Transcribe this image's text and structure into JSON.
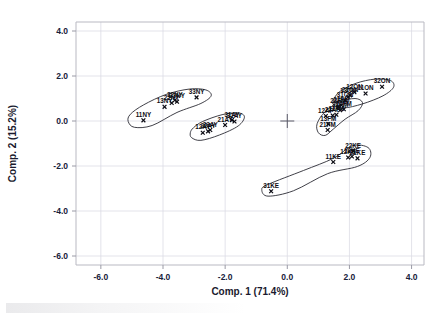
{
  "chart_data": {
    "type": "scatter",
    "title": "",
    "xlabel": "Comp. 1 (71.4%)",
    "ylabel": "Comp. 2 (15.2%)",
    "xlim": [
      -6.8,
      4.4
    ],
    "ylim": [
      -6.4,
      4.4
    ],
    "xticks": [
      "-6.0",
      "-4.0",
      "-2.0",
      "0.0",
      "2.0",
      "4.0"
    ],
    "xtick_values": [
      -6.0,
      -4.0,
      -2.0,
      0.0,
      2.0,
      4.0
    ],
    "yticks": [
      "4.0",
      "2.0",
      "0.0",
      "-2.0",
      "-4.0",
      "-6.0"
    ],
    "ytick_values": [
      4.0,
      2.0,
      0.0,
      -2.0,
      -4.0,
      -6.0
    ],
    "grid": true,
    "legend": "none",
    "marker": "x",
    "origin_cross": true,
    "groups": [
      {
        "name": "NY",
        "points": [
          {
            "label": "11NY",
            "x": -4.63,
            "y": 0.03
          },
          {
            "label": "13NY",
            "x": -3.95,
            "y": 0.63
          },
          {
            "label": "32NY",
            "x": -3.62,
            "y": 0.92
          },
          {
            "label": "22NY",
            "x": -3.72,
            "y": 0.8
          },
          {
            "label": "23NY",
            "x": -3.55,
            "y": 0.86
          },
          {
            "label": "33NY",
            "x": -2.92,
            "y": 1.05
          }
        ],
        "hull": [
          [
            -5.05,
            0.3
          ],
          [
            -4.62,
            0.72
          ],
          [
            -3.9,
            1.18
          ],
          [
            -3.15,
            1.42
          ],
          [
            -2.62,
            1.38
          ],
          [
            -2.45,
            1.12
          ],
          [
            -2.78,
            0.78
          ],
          [
            -3.55,
            0.38
          ],
          [
            -4.35,
            -0.2
          ],
          [
            -4.92,
            -0.28
          ],
          [
            -5.12,
            -0.02
          ]
        ]
      },
      {
        "name": "AY",
        "points": [
          {
            "label": "12AY",
            "x": -2.72,
            "y": -0.52
          },
          {
            "label": "22AY",
            "x": -2.55,
            "y": -0.46
          },
          {
            "label": "23AY",
            "x": -2.48,
            "y": -0.4
          },
          {
            "label": "21AY",
            "x": -2.0,
            "y": -0.18
          },
          {
            "label": "31AY",
            "x": -1.78,
            "y": 0.04
          },
          {
            "label": "32AY",
            "x": -1.7,
            "y": -0.02
          }
        ],
        "hull": [
          [
            -3.02,
            -0.3
          ],
          [
            -2.72,
            -0.02
          ],
          [
            -2.1,
            0.28
          ],
          [
            -1.58,
            0.36
          ],
          [
            -1.38,
            0.18
          ],
          [
            -1.58,
            -0.22
          ],
          [
            -2.18,
            -0.62
          ],
          [
            -2.78,
            -0.86
          ],
          [
            -3.08,
            -0.74
          ],
          [
            -3.12,
            -0.52
          ]
        ]
      },
      {
        "name": "ON",
        "points": [
          {
            "label": "12ON",
            "x": 2.16,
            "y": 1.28
          },
          {
            "label": "11ON",
            "x": 2.52,
            "y": 1.22
          },
          {
            "label": "21ON",
            "x": 2.02,
            "y": 1.14
          },
          {
            "label": "13ON",
            "x": 1.96,
            "y": 1.08
          },
          {
            "label": "32ON",
            "x": 3.05,
            "y": 1.52
          },
          {
            "label": "31ON",
            "x": 1.86,
            "y": 0.92
          }
        ],
        "hull": [
          [
            1.5,
            0.98
          ],
          [
            1.72,
            1.34
          ],
          [
            2.22,
            1.68
          ],
          [
            2.82,
            1.86
          ],
          [
            3.32,
            1.8
          ],
          [
            3.42,
            1.5
          ],
          [
            3.08,
            1.12
          ],
          [
            2.42,
            0.76
          ],
          [
            1.82,
            0.58
          ],
          [
            1.5,
            0.7
          ]
        ]
      },
      {
        "name": "FM-AP",
        "points": [
          {
            "label": "12AP",
            "x": 1.24,
            "y": 0.22
          },
          {
            "label": "22AP",
            "x": 1.46,
            "y": 0.24
          },
          {
            "label": "11FM",
            "x": 1.58,
            "y": 0.28
          },
          {
            "label": "12FM",
            "x": 1.82,
            "y": 0.52
          },
          {
            "label": "32FM",
            "x": 1.7,
            "y": 0.48
          },
          {
            "label": "23FM",
            "x": 1.64,
            "y": 0.64
          },
          {
            "label": "22FM",
            "x": 1.74,
            "y": 0.7
          },
          {
            "label": "13FM",
            "x": 1.32,
            "y": -0.14
          },
          {
            "label": "21FM",
            "x": 1.3,
            "y": -0.4
          }
        ],
        "hull": [
          [
            1.0,
            -0.52
          ],
          [
            0.96,
            -0.12
          ],
          [
            1.22,
            0.42
          ],
          [
            1.68,
            0.84
          ],
          [
            2.18,
            1.0
          ],
          [
            2.42,
            0.82
          ],
          [
            2.28,
            0.46
          ],
          [
            1.86,
            0.08
          ],
          [
            1.48,
            -0.36
          ],
          [
            1.22,
            -0.64
          ]
        ]
      },
      {
        "name": "KE",
        "points": [
          {
            "label": "31KE",
            "x": -0.52,
            "y": -3.12
          },
          {
            "label": "11KE",
            "x": 1.48,
            "y": -1.82
          },
          {
            "label": "12KE",
            "x": 1.96,
            "y": -1.62
          },
          {
            "label": "13KE",
            "x": 2.08,
            "y": -1.58
          },
          {
            "label": "22KE",
            "x": 2.12,
            "y": -1.34
          },
          {
            "label": "21KE",
            "x": 2.26,
            "y": -1.66
          }
        ],
        "hull": [
          [
            -0.82,
            -3.06
          ],
          [
            -0.62,
            -2.82
          ],
          [
            0.52,
            -2.2
          ],
          [
            1.48,
            -1.66
          ],
          [
            2.1,
            -1.1
          ],
          [
            2.6,
            -1.18
          ],
          [
            2.66,
            -1.62
          ],
          [
            2.26,
            -2.02
          ],
          [
            1.3,
            -2.34
          ],
          [
            0.2,
            -3.1
          ],
          [
            -0.62,
            -3.34
          ]
        ]
      }
    ]
  }
}
